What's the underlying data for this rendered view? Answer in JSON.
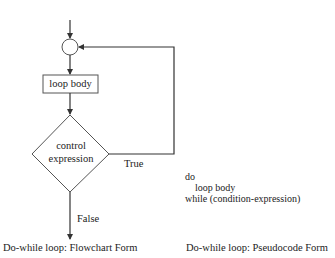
{
  "flowchart": {
    "process_box": {
      "label": "loop body"
    },
    "decision": {
      "line1": "control",
      "line2": "expression"
    },
    "branch_true": {
      "label": "True"
    },
    "branch_false": {
      "label": "False"
    },
    "caption": "Do-while loop: Flowchart Form"
  },
  "pseudocode": {
    "lines": [
      "do",
      "loop body",
      "while (condition-expression)"
    ],
    "caption": "Do-while loop: Pseudocode Form"
  },
  "colors": {
    "stroke": "#333333",
    "text": "#222222",
    "background": "#ffffff"
  }
}
